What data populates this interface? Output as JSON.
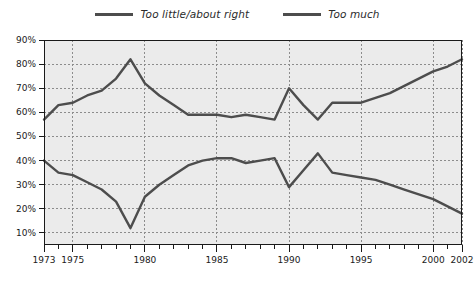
{
  "legend": {
    "position": "top-center",
    "entries": [
      {
        "label": "Too little/about right",
        "color": "#4d4d4d",
        "name": "too-little-about-right"
      },
      {
        "label": "Too much",
        "color": "#4d4d4d",
        "name": "too-much"
      }
    ]
  },
  "axes": {
    "y_ticks": [
      "10%",
      "20%",
      "30%",
      "40%",
      "50%",
      "60%",
      "70%",
      "80%",
      "90%"
    ],
    "x_ticks": [
      "1973",
      "1975",
      "1980",
      "1985",
      "1990",
      "1995",
      "2000",
      "2002"
    ]
  },
  "style": {
    "plot_background": "#ebebeb",
    "plot_border": "#1a1a1a",
    "gridline": "#8c8c8c",
    "line_color": "#4d4d4d"
  },
  "chart_data": {
    "type": "line",
    "title": "",
    "subtitle": "",
    "xlabel": "",
    "ylabel": "",
    "xlim": [
      1973,
      2002
    ],
    "ylim": [
      5,
      90
    ],
    "grid": true,
    "legend_position": "top-center",
    "x": [
      1973,
      1974,
      1975,
      1976,
      1977,
      1978,
      1979,
      1980,
      1981,
      1982,
      1983,
      1984,
      1985,
      1986,
      1987,
      1988,
      1989,
      1990,
      1991,
      1992,
      1993,
      1994,
      1995,
      1996,
      1997,
      1998,
      1999,
      2000,
      2001,
      2002
    ],
    "x_tick_labels": [
      "1973",
      "1975",
      "1980",
      "1985",
      "1990",
      "1995",
      "2000",
      "2002"
    ],
    "y_tick_values": [
      10,
      20,
      30,
      40,
      50,
      60,
      70,
      80,
      90
    ],
    "y_tick_labels": [
      "10%",
      "20%",
      "30%",
      "40%",
      "50%",
      "60%",
      "70%",
      "80%",
      "90%"
    ],
    "series": [
      {
        "name": "Too little/about right",
        "color": "#4d4d4d",
        "values": [
          57,
          63,
          64,
          67,
          69,
          74,
          82,
          72,
          67,
          63,
          59,
          59,
          59,
          58,
          59,
          58,
          57,
          70,
          63,
          57,
          64,
          64,
          64,
          66,
          68,
          71,
          74,
          77,
          79,
          82
        ]
      },
      {
        "name": "Too much",
        "color": "#4d4d4d",
        "values": [
          40,
          35,
          34,
          31,
          28,
          23,
          12,
          25,
          30,
          34,
          38,
          40,
          41,
          41,
          39,
          40,
          41,
          29,
          36,
          43,
          35,
          34,
          33,
          32,
          30,
          28,
          26,
          24,
          21,
          18
        ]
      }
    ]
  }
}
